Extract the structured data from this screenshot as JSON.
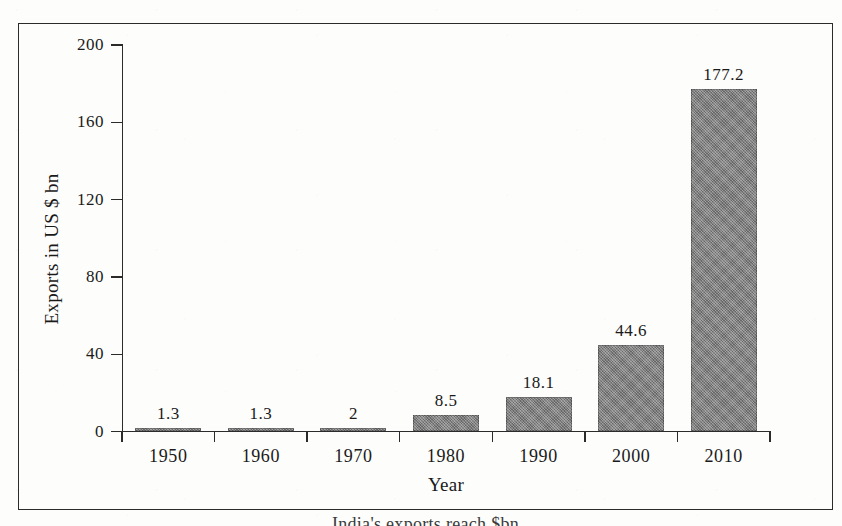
{
  "figure": {
    "y_axis_title": "Exports in US $ bn",
    "x_axis_title": "Year",
    "caption": "India's exports reach $bn"
  },
  "chart_data": {
    "type": "bar",
    "title": "",
    "xlabel": "Year",
    "ylabel": "Exports in US $ bn",
    "categories": [
      "1950",
      "1960",
      "1970",
      "1980",
      "1990",
      "2000",
      "2010"
    ],
    "values": [
      1.3,
      1.3,
      2,
      8.5,
      18.1,
      44.6,
      177.2
    ],
    "value_labels": [
      "1.3",
      "1.3",
      "2",
      "8.5",
      "18.1",
      "44.6",
      "177.2"
    ],
    "ylim": [
      0,
      200
    ],
    "ytick_values": [
      0,
      40,
      80,
      120,
      160,
      200
    ],
    "ytick_labels": [
      "0",
      "40",
      "80",
      "120",
      "160",
      "200"
    ],
    "grid": false,
    "legend": false,
    "bar_color": "#7c7c7c",
    "axis_color": "#2b2b2b"
  }
}
